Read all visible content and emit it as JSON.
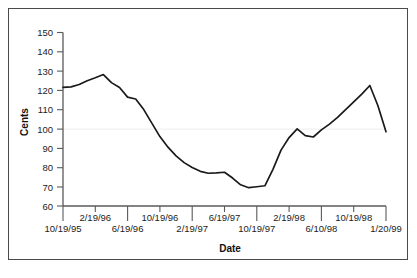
{
  "figure": {
    "background_color": "#ffffff",
    "frame_color": "#4a4a4a",
    "line_color": "#1a1a1a",
    "axis_color": "#5a5a5a"
  },
  "chart_data": {
    "type": "line",
    "title": "",
    "xlabel": "Date",
    "ylabel": "Cents",
    "ylim": [
      60,
      150
    ],
    "ytick_labels": [
      "150",
      "140",
      "130",
      "120",
      "110",
      "100",
      "90",
      "80",
      "70",
      "60"
    ],
    "ytick_values": [
      150,
      140,
      130,
      120,
      110,
      100,
      90,
      80,
      70,
      60
    ],
    "xtick_labels": [
      "10/19/95",
      "2/19/96",
      "6/19/96",
      "10/19/96",
      "2/19/97",
      "6/19/97",
      "10/19/97",
      "2/19/98",
      "6/10/98",
      "10/19/98",
      "1/20/99"
    ],
    "xtick_stagger": "alternating two rows, first label on lower row",
    "grid": false,
    "legend": null,
    "series": [
      {
        "name": "Cents",
        "x": [
          "10/19/95",
          "12/19/95",
          "2/19/96",
          "4/19/96",
          "5/19/96",
          "6/19/96",
          "7/19/96",
          "8/19/96",
          "10/19/96",
          "11/19/96",
          "12/19/96",
          "1/19/97",
          "2/19/97",
          "3/19/97",
          "4/19/97",
          "5/19/97",
          "6/19/97",
          "7/19/97",
          "8/19/97",
          "9/19/97",
          "10/19/97",
          "11/19/97",
          "12/19/97",
          "1/19/98",
          "2/19/98",
          "3/19/98",
          "4/19/98",
          "5/19/98",
          "6/10/98",
          "7/19/98",
          "8/19/98",
          "10/19/98",
          "11/19/98",
          "1/20/99"
        ],
        "values": [
          121.5,
          121.8,
          123.0,
          125.0,
          126.5,
          128.2,
          124.0,
          121.5,
          116.5,
          115.5,
          110.0,
          103.0,
          96.0,
          90.5,
          86.0,
          82.5,
          80.0,
          78.0,
          77.0,
          77.2,
          77.5,
          74.5,
          71.0,
          69.5,
          70.0,
          70.5,
          79.0,
          89.0,
          95.5,
          100.0,
          96.5,
          95.8,
          99.5,
          102.5
        ],
        "key_points": {
          "start": 121.5,
          "first_peak": 128.2,
          "minimum": 69.5,
          "secondary_peak": 100.0,
          "final_peak": 122.5,
          "end": 98.5
        }
      }
    ],
    "series_values_full": [
      121.5,
      121.8,
      123.0,
      125.0,
      126.5,
      128.2,
      124.0,
      121.5,
      116.5,
      115.5,
      110.0,
      103.0,
      96.0,
      90.5,
      86.0,
      82.5,
      80.0,
      78.0,
      77.0,
      77.2,
      77.5,
      74.5,
      71.0,
      69.5,
      70.0,
      70.5,
      79.0,
      89.0,
      95.5,
      100.0,
      96.5,
      95.8,
      99.5,
      102.5,
      106.0,
      110.0,
      114.0,
      118.0,
      122.5,
      112.0,
      98.5
    ]
  }
}
